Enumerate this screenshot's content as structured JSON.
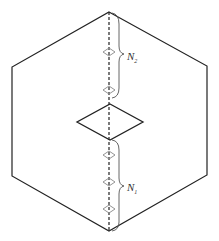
{
  "diagram": {
    "labels": {
      "upper": {
        "main": "N",
        "sub": "2"
      },
      "lower": {
        "main": "N",
        "sub": "1"
      }
    },
    "colors": {
      "stroke": "#222222",
      "diamond": "#888888",
      "brace": "#555555"
    },
    "hexagon": {
      "points": "109,12 207,66 207,175 109,231 12,176 12,67"
    },
    "central_rhombus": {
      "points": "110,104 143,122 110,140 77,122"
    },
    "small_diamonds_y": [
      52,
      90,
      155,
      182,
      209
    ]
  }
}
